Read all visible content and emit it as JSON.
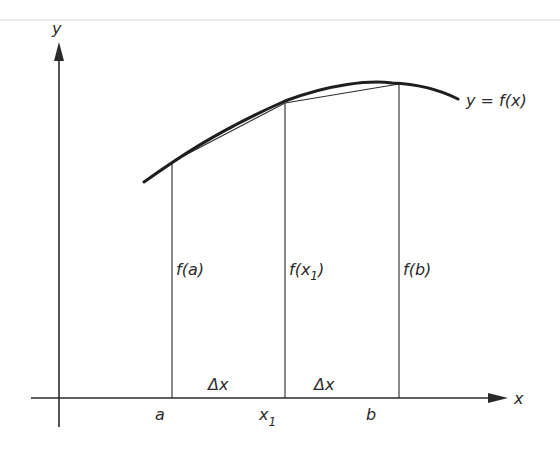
{
  "colors": {
    "background": "#ffffff",
    "ink": "#2a2a2a",
    "top_rule": "#e6e6e6"
  },
  "axes": {
    "x_label": "x",
    "y_label": "y"
  },
  "curve": {
    "label": "y = f(x)"
  },
  "points": [
    {
      "tick_label": "a",
      "value_label": "f(a)"
    },
    {
      "tick_label": "x",
      "tick_sub": "1",
      "value_label_prefix": "f(x",
      "value_label_sub": "1",
      "value_label_suffix": ")"
    },
    {
      "tick_label": "b",
      "value_label": "f(b)"
    }
  ],
  "intervals": [
    {
      "label": "Δx"
    },
    {
      "label": "Δx"
    }
  ]
}
